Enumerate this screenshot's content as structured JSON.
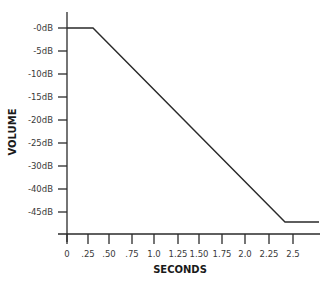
{
  "chart_data": {
    "type": "line",
    "title": "",
    "xlabel": "SECONDS",
    "ylabel": "VOLUME",
    "x_ticks": [
      {
        "label": "0",
        "value": 0,
        "px": 67
      },
      {
        "label": ".25",
        "value": 0.25,
        "px": 88
      },
      {
        "label": ".50",
        "value": 0.5,
        "px": 109
      },
      {
        "label": ".75",
        "value": 0.75,
        "px": 132
      },
      {
        "label": "1.0",
        "value": 1.0,
        "px": 154
      },
      {
        "label": "1.25",
        "value": 1.25,
        "px": 178
      },
      {
        "label": "1.50",
        "value": 1.5,
        "px": 199
      },
      {
        "label": "1.75",
        "value": 1.75,
        "px": 222
      },
      {
        "label": "2.0",
        "value": 2.0,
        "px": 245
      },
      {
        "label": "2.25",
        "value": 2.25,
        "px": 269
      },
      {
        "label": "2.5",
        "value": 2.5,
        "px": 293
      }
    ],
    "y_ticks": [
      {
        "label": "-0dB",
        "value": 0,
        "px": 28
      },
      {
        "label": "-5dB",
        "value": -5,
        "px": 51
      },
      {
        "label": "-10dB",
        "value": -10,
        "px": 74
      },
      {
        "label": "-15dB",
        "value": -15,
        "px": 97
      },
      {
        "label": "-20dB",
        "value": -20,
        "px": 120
      },
      {
        "label": "-25dB",
        "value": -25,
        "px": 143
      },
      {
        "label": "-30dB",
        "value": -30,
        "px": 166
      },
      {
        "label": "-40dB",
        "value": -40,
        "px": 189
      },
      {
        "label": "-45dB",
        "value": -45,
        "px": 212
      }
    ],
    "series": [
      {
        "name": "volume envelope",
        "color": "#2a2a2a",
        "x": [
          0,
          0.3,
          2.4,
          2.8
        ],
        "y": [
          0,
          0,
          -47,
          -47
        ],
        "points_px": [
          [
            67,
            28
          ],
          [
            93,
            28
          ],
          [
            285,
            222
          ],
          [
            319,
            222
          ]
        ]
      }
    ],
    "xlim": [
      0,
      2.8
    ],
    "grid": false,
    "legend": null
  }
}
